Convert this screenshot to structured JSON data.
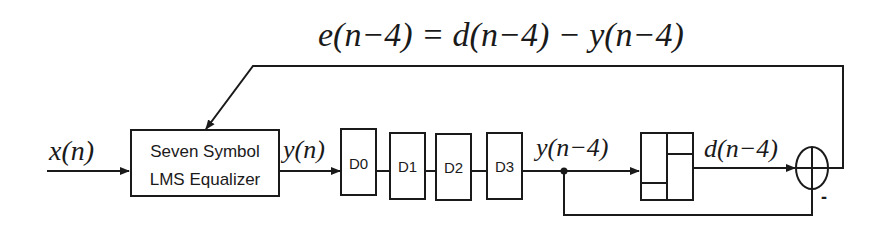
{
  "diagram": {
    "title_equation": {
      "parts": [
        "e",
        "(",
        "n",
        " − 4",
        ")",
        " = ",
        "d",
        "(",
        "n",
        " − 4",
        ")",
        " − ",
        "y",
        "(",
        "n",
        " − 4",
        ")"
      ],
      "text": "e(n−4) = d(n−4) − y(n−4)"
    },
    "input_label": "x(n)",
    "equalizer": {
      "line1": "Seven Symbol",
      "line2": "LMS Equalizer"
    },
    "equalizer_output_label": "y(n)",
    "delays": [
      {
        "label": "D0"
      },
      {
        "label": "D1"
      },
      {
        "label": "D2"
      },
      {
        "label": "D3"
      }
    ],
    "delayed_output_label": "y(n−4)",
    "decision_output_label": "d(n−4)",
    "summer_minus_sign": "-",
    "colors": {
      "stroke": "#1a1a1a",
      "background": "#ffffff"
    }
  }
}
